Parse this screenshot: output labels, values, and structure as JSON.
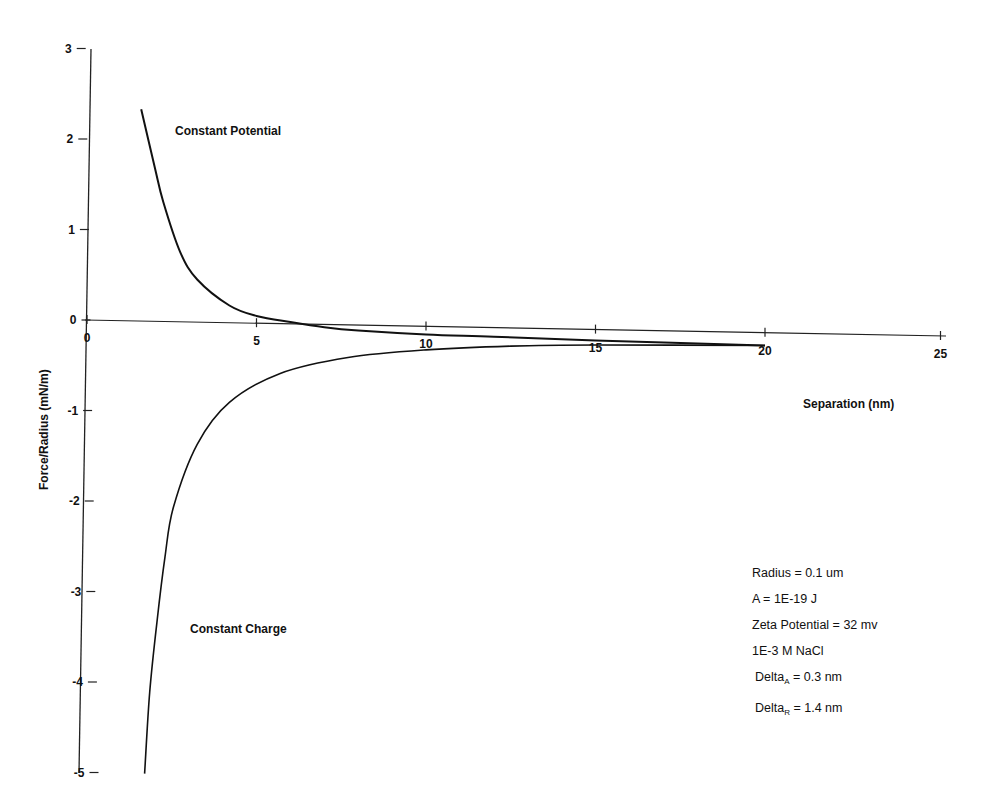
{
  "chart_data": {
    "type": "line",
    "title": "",
    "xlabel": "Separation (nm)",
    "ylabel": "Force/Radius (mN/m)",
    "xlim": [
      0,
      25
    ],
    "ylim": [
      -5,
      3
    ],
    "x_ticks": [
      0,
      5,
      10,
      15,
      20,
      25
    ],
    "y_ticks": [
      3,
      2,
      1,
      0,
      -1,
      -2,
      -3,
      -4,
      -5
    ],
    "grid": false,
    "legend": "none (curves labeled inline)",
    "series": [
      {
        "name": "Constant Potential",
        "x": [
          1.6,
          2.0,
          2.25,
          2.75,
          3.25,
          4.2,
          5.0,
          6.0,
          7.0,
          8.0,
          10.0,
          12.0,
          15.0,
          20.0
        ],
        "y": [
          2.34,
          1.7,
          1.32,
          0.77,
          0.47,
          0.19,
          0.08,
          0.02,
          -0.03,
          -0.06,
          -0.09,
          -0.1,
          -0.12,
          -0.14
        ]
      },
      {
        "name": "Constant Charge",
        "x": [
          1.7,
          1.85,
          2.07,
          2.3,
          2.55,
          3.25,
          4.2,
          5.7,
          7.7,
          10.0,
          12.5,
          15.0,
          20.0
        ],
        "y": [
          -5.0,
          -4.1,
          -3.3,
          -2.6,
          -2.05,
          -1.35,
          -0.88,
          -0.55,
          -0.36,
          -0.26,
          -0.2,
          -0.17,
          -0.14
        ]
      }
    ],
    "annotations": [
      "Radius = 0.1 um",
      "A = 1E-19 J",
      "Zeta Potential = 32 mv",
      "1E-3 M NaCl",
      "DeltaA = 0.3 nm",
      "DeltaR = 1.4 nm"
    ]
  },
  "axes": {
    "x_title": "Separation (nm)",
    "y_title": "Force/Radius (mN/m)",
    "x_tick_labels": [
      "0",
      "5",
      "10",
      "15",
      "20",
      "25"
    ],
    "y_tick_labels": [
      "3",
      "2",
      "1",
      "0",
      "-1",
      "-2",
      "-3",
      "-4",
      "-5"
    ]
  },
  "labels": {
    "constant_potential": "Constant Potential",
    "constant_charge": "Constant Charge"
  },
  "annotation_box": {
    "radius": "Radius = 0.1 um",
    "hamaker": "A = 1E-19 J",
    "zeta": "Zeta Potential = 32 mv",
    "salt": "1E-3 M NaCl",
    "delta_a_prefix": "Delta",
    "delta_a_sub": "A",
    "delta_a_value": " = 0.3 nm",
    "delta_r_prefix": "Delta",
    "delta_r_sub": "R",
    "delta_r_value": " = 1.4 nm"
  },
  "colors": {
    "line": "#111111",
    "axis": "#222222",
    "background": "#ffffff"
  }
}
